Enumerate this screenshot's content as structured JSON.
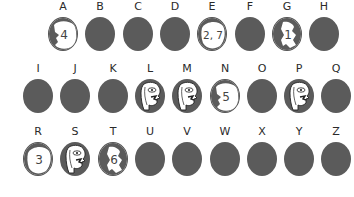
{
  "puzzle": {
    "rows": [
      {
        "cells": [
          {
            "letter": "A",
            "type": "map",
            "number": "4"
          },
          {
            "letter": "B",
            "type": "blank"
          },
          {
            "letter": "C",
            "type": "blank"
          },
          {
            "letter": "D",
            "type": "blank"
          },
          {
            "letter": "E",
            "type": "map",
            "number": "2, 7"
          },
          {
            "letter": "F",
            "type": "blank"
          },
          {
            "letter": "G",
            "type": "map",
            "number": "1"
          },
          {
            "letter": "H",
            "type": "blank"
          }
        ]
      },
      {
        "cells": [
          {
            "letter": "I",
            "type": "blank"
          },
          {
            "letter": "J",
            "type": "blank"
          },
          {
            "letter": "K",
            "type": "blank"
          },
          {
            "letter": "L",
            "type": "face"
          },
          {
            "letter": "M",
            "type": "face"
          },
          {
            "letter": "N",
            "type": "map",
            "number": "5"
          },
          {
            "letter": "O",
            "type": "blank"
          },
          {
            "letter": "P",
            "type": "face"
          },
          {
            "letter": "Q",
            "type": "blank"
          }
        ]
      },
      {
        "cells": [
          {
            "letter": "R",
            "type": "map",
            "number": "3"
          },
          {
            "letter": "S",
            "type": "face"
          },
          {
            "letter": "T",
            "type": "map",
            "number": "6"
          },
          {
            "letter": "U",
            "type": "blank"
          },
          {
            "letter": "V",
            "type": "blank"
          },
          {
            "letter": "W",
            "type": "blank"
          },
          {
            "letter": "X",
            "type": "blank"
          },
          {
            "letter": "Y",
            "type": "blank"
          },
          {
            "letter": "Z",
            "type": "blank"
          }
        ]
      }
    ],
    "colors": {
      "disc": "#5b5b5b",
      "label": "#2a2a2a",
      "paper": "#ffffff",
      "number": "#444444"
    }
  }
}
